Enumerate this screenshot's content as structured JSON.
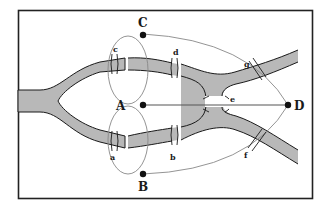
{
  "diagram": {
    "nodes": [
      {
        "id": "A",
        "label": "A"
      },
      {
        "id": "B",
        "label": "B"
      },
      {
        "id": "C",
        "label": "C"
      },
      {
        "id": "D",
        "label": "D"
      }
    ],
    "bridges": [
      {
        "id": "a",
        "label": "a"
      },
      {
        "id": "b",
        "label": "b"
      },
      {
        "id": "c",
        "label": "c"
      },
      {
        "id": "d",
        "label": "d"
      },
      {
        "id": "e",
        "label": "e"
      },
      {
        "id": "f",
        "label": "f"
      },
      {
        "id": "g",
        "label": "g"
      }
    ],
    "colors": {
      "river": "#b8b8b8",
      "river_edge": "#1a1a1a",
      "edge": "#888888",
      "node": "#111111",
      "frame": "#222222"
    }
  }
}
